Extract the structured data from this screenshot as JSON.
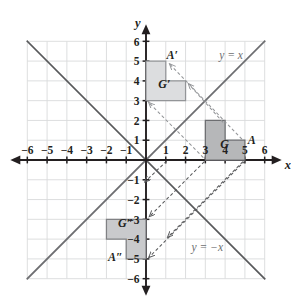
{
  "figure": {
    "axes": {
      "x_letter": "x",
      "y_letter": "y",
      "x_min": -6,
      "x_max": 6,
      "y_min": -6,
      "y_max": 6,
      "x_ticks": [
        {
          "value": -6,
          "label": "−6"
        },
        {
          "value": -5,
          "label": "−5"
        },
        {
          "value": -4,
          "label": "−4"
        },
        {
          "value": -3,
          "label": "−3"
        },
        {
          "value": -2,
          "label": "−2"
        },
        {
          "value": -1,
          "label": "−1"
        },
        {
          "value": 1,
          "label": "1"
        },
        {
          "value": 2,
          "label": "2"
        },
        {
          "value": 3,
          "label": "3"
        },
        {
          "value": 4,
          "label": "4"
        },
        {
          "value": 5,
          "label": "5"
        },
        {
          "value": 6,
          "label": "6"
        }
      ],
      "y_ticks": [
        {
          "value": 6,
          "label": "6"
        },
        {
          "value": 5,
          "label": "5"
        },
        {
          "value": 4,
          "label": "4"
        },
        {
          "value": 3,
          "label": "3"
        },
        {
          "value": 2,
          "label": "2"
        },
        {
          "value": 1,
          "label": "1"
        },
        {
          "value": -1,
          "label": "−1"
        },
        {
          "value": -2,
          "label": "−2"
        },
        {
          "value": -3,
          "label": "−3"
        },
        {
          "value": -4,
          "label": "−4"
        },
        {
          "value": -5,
          "label": "−5"
        },
        {
          "value": -6,
          "label": "−6"
        }
      ]
    },
    "lines": [
      {
        "name": "line-y-equals-x",
        "label": "y = x",
        "equation": "y = x",
        "slope": 1,
        "intercept": 0,
        "label_at": [
          4.3,
          5.1
        ],
        "color": "#6d6e71",
        "style": "solid"
      },
      {
        "name": "line-y-equals-minus-x",
        "label": "y = −x",
        "equation": "y = -x",
        "slope": -1,
        "intercept": 0,
        "label_at": [
          3.1,
          -4.6
        ],
        "color": "#58595b",
        "style": "solid"
      }
    ],
    "shapes": [
      {
        "name": "figure-g",
        "label": "G",
        "label_at": [
          3.75,
          0.62
        ],
        "fill": "#b6b7b9",
        "stroke": "#6d6e71",
        "vertices": [
          [
            3,
            0
          ],
          [
            3,
            2
          ],
          [
            4,
            2
          ],
          [
            4,
            1
          ],
          [
            5,
            1
          ],
          [
            5,
            0
          ]
        ],
        "vertex_label": {
          "text": "A",
          "point": [
            5,
            1
          ],
          "label_at": [
            5.35,
            1.0
          ]
        }
      },
      {
        "name": "figure-g-prime",
        "label": "G′",
        "label_at": [
          0.62,
          3.62
        ],
        "fill": "#dcdddf",
        "stroke": "#939598",
        "vertices": [
          [
            0,
            3
          ],
          [
            0,
            5
          ],
          [
            1,
            5
          ],
          [
            1,
            4
          ],
          [
            2,
            4
          ],
          [
            2,
            3
          ]
        ],
        "vertex_label": {
          "text": "A′",
          "point": [
            1,
            5
          ],
          "label_at": [
            1.32,
            5.32
          ]
        }
      },
      {
        "name": "figure-g-double-prime",
        "label": "G″",
        "label_at": [
          -1.42,
          -3.4
        ],
        "fill": "#c9cacc",
        "stroke": "#808184",
        "vertices": [
          [
            0,
            -3
          ],
          [
            -2,
            -3
          ],
          [
            -2,
            -4
          ],
          [
            -1,
            -4
          ],
          [
            -1,
            -5
          ],
          [
            0,
            -5
          ]
        ],
        "vertex_label": {
          "text": "A″",
          "point": [
            -1,
            -5
          ],
          "label_at": [
            -1.55,
            -4.88
          ]
        }
      }
    ],
    "mapping_arrows": [
      {
        "name": "arrow-g-to-gprime-1",
        "from": [
          3.9,
          1.9
        ],
        "to": [
          2.15,
          3.85
        ],
        "dashed": true,
        "color": "#939598"
      },
      {
        "name": "arrow-g-to-gprime-2",
        "from": [
          4.85,
          1.05
        ],
        "to": [
          1.2,
          4.85
        ],
        "dashed": true,
        "color": "#939598"
      },
      {
        "name": "arrow-g-to-gprime-3",
        "from": [
          2.9,
          0.12
        ],
        "to": [
          0.15,
          2.9
        ],
        "dashed": true,
        "color": "#939598"
      },
      {
        "name": "arrow-gprime-to-gpp-1",
        "from": [
          1.05,
          -0.05
        ],
        "to": [
          -0.05,
          -1.1
        ],
        "dashed": true,
        "color": "#58595b"
      },
      {
        "name": "arrow-gprime-to-gpp-2",
        "from": [
          2.95,
          -0.08
        ],
        "to": [
          0.18,
          -2.85
        ],
        "dashed": true,
        "color": "#58595b"
      },
      {
        "name": "arrow-gprime-to-gpp-3",
        "from": [
          4.9,
          -0.08
        ],
        "to": [
          1.1,
          -3.9
        ],
        "dashed": true,
        "color": "#58595b"
      },
      {
        "name": "arrow-gprime-to-gpp-4",
        "from": [
          5.0,
          -0.05
        ],
        "to": [
          0.15,
          -4.92
        ],
        "dashed": true,
        "color": "#58595b"
      }
    ],
    "grid": {
      "show": true,
      "color": "#d9dadb",
      "step": 1
    }
  }
}
